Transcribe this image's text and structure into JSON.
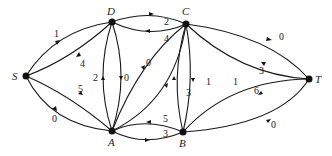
{
  "diagram": {
    "type": "directed-network-flow",
    "nodes": [
      {
        "id": "S",
        "label": "S",
        "x": 26,
        "y": 76
      },
      {
        "id": "D",
        "label": "D",
        "x": 112,
        "y": 22
      },
      {
        "id": "C",
        "label": "C",
        "x": 186,
        "y": 24
      },
      {
        "id": "T",
        "label": "T",
        "x": 309,
        "y": 79
      },
      {
        "id": "A",
        "label": "A",
        "x": 112,
        "y": 131
      },
      {
        "id": "B",
        "label": "B",
        "x": 183,
        "y": 132
      }
    ],
    "edges": [
      {
        "from": "S",
        "to": "D",
        "label": "1"
      },
      {
        "from": "D",
        "to": "S",
        "label": "4"
      },
      {
        "from": "S",
        "to": "A",
        "label": "0"
      },
      {
        "from": "A",
        "to": "S",
        "label": "5"
      },
      {
        "from": "D",
        "to": "C",
        "label": "2"
      },
      {
        "from": "C",
        "to": "D",
        "label": "4"
      },
      {
        "from": "A",
        "to": "D",
        "label": "2"
      },
      {
        "from": "D",
        "to": "A",
        "label": "0"
      },
      {
        "from": "A",
        "to": "C",
        "label": "0"
      },
      {
        "from": "C",
        "to": "A",
        "label": "3"
      },
      {
        "from": "B",
        "to": "A",
        "label": "5"
      },
      {
        "from": "A",
        "to": "B",
        "label": "3"
      },
      {
        "from": "B",
        "to": "C",
        "label": "1"
      },
      {
        "from": "C",
        "to": "B",
        "label": "1"
      },
      {
        "from": "C",
        "to": "T",
        "label": "0"
      },
      {
        "from": "T",
        "to": "C",
        "label": "3"
      },
      {
        "from": "T",
        "to": "B",
        "label": "6"
      },
      {
        "from": "B",
        "to": "T",
        "label": "0"
      }
    ]
  }
}
